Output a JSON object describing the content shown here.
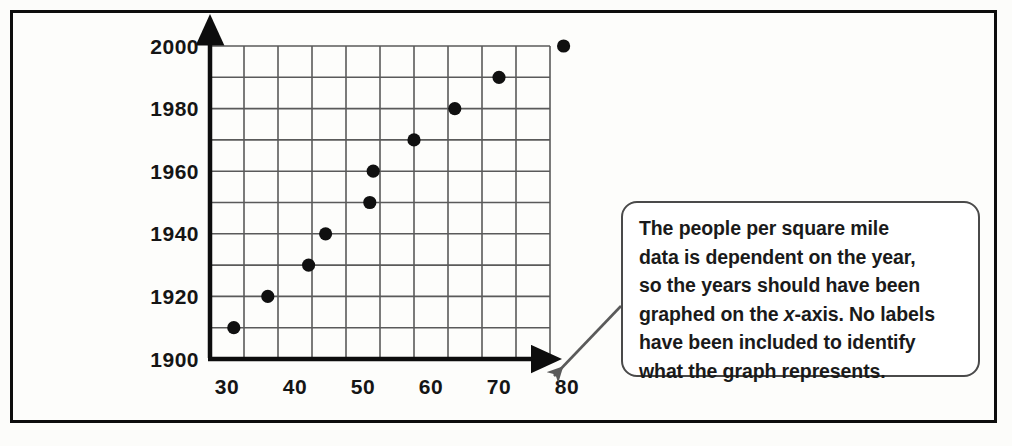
{
  "figure": {
    "border_color": "#0d0d0d",
    "background": "#fdfdfb"
  },
  "callout": {
    "text": "The people per square mile\ndata is dependent on the year,\nso the years should have been\ngraphed on the x-axis. No labels\nhave been included to identify\nwhat the graph represents.",
    "line1": "The people per square mile",
    "line2": "data is dependent on the year,",
    "line3": "so the years should have been",
    "line4_a": "graphed on the ",
    "line4_italic": "x",
    "line4_b": "-axis. No labels",
    "line5": "have been included to identify",
    "line6": "what the graph represents.",
    "border_color": "#4a4a4a",
    "background": "#ffffff"
  },
  "chart_data": {
    "type": "scatter",
    "title": "",
    "xlabel": "",
    "ylabel": "",
    "xlim": [
      27.5,
      77.5
    ],
    "ylim": [
      1900,
      2000
    ],
    "grid": true,
    "legend": "none",
    "xticks": [
      30,
      40,
      50,
      60,
      70,
      80
    ],
    "yticks": [
      1900,
      1920,
      1940,
      1960,
      1980,
      2000
    ],
    "xtick_labels": [
      "30",
      "40",
      "50",
      "60",
      "70",
      "80"
    ],
    "ytick_labels": [
      "1900",
      "1920",
      "1940",
      "1960",
      "1980",
      "2000"
    ],
    "x_grid_step": 5,
    "y_grid_step": 10,
    "x_grid_count": 10,
    "y_grid_count": 10,
    "point_color": "#101010",
    "grid_color": "#5a5a5a",
    "axis_color": "#0d0d0d",
    "x_description": "people per square mile",
    "y_description": "year",
    "points": [
      {
        "x": 31.0,
        "y": 1910
      },
      {
        "x": 36.0,
        "y": 1920
      },
      {
        "x": 42.0,
        "y": 1930
      },
      {
        "x": 44.5,
        "y": 1940
      },
      {
        "x": 51.0,
        "y": 1950
      },
      {
        "x": 51.5,
        "y": 1960
      },
      {
        "x": 57.5,
        "y": 1970
      },
      {
        "x": 63.5,
        "y": 1980
      },
      {
        "x": 70.0,
        "y": 1990
      },
      {
        "x": 79.5,
        "y": 2000
      }
    ],
    "series": [
      {
        "name": "population density by year",
        "x": [
          31.0,
          36.0,
          42.0,
          44.5,
          51.0,
          51.5,
          57.5,
          63.5,
          70.0,
          79.5
        ],
        "values": [
          1910,
          1920,
          1930,
          1940,
          1950,
          1960,
          1970,
          1980,
          1990,
          2000
        ]
      }
    ]
  }
}
